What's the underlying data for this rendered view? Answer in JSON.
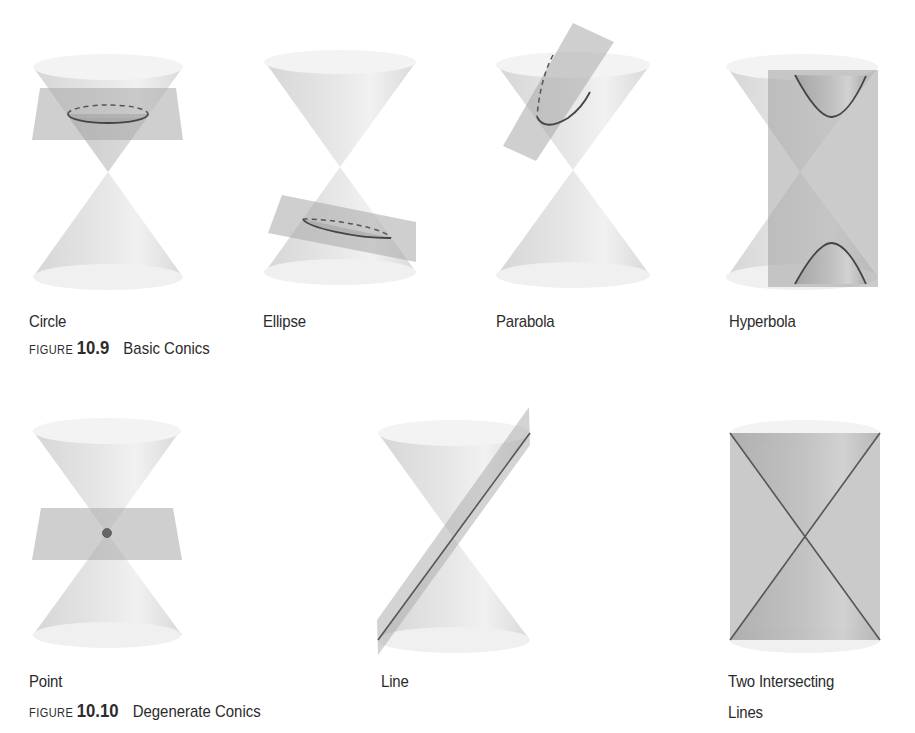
{
  "colors": {
    "background": "#ffffff",
    "cone_fill": "#e4e4e4",
    "cone_rim": "#f2f2f2",
    "plane_fill": "#bdbdbd",
    "curve_stroke": "#555555",
    "text": "#2b2b2b"
  },
  "figure_basic": {
    "word": "FIGURE",
    "number": "10.9",
    "title": "Basic Conics",
    "items": [
      {
        "label": "Circle",
        "type": "circle"
      },
      {
        "label": "Ellipse",
        "type": "ellipse"
      },
      {
        "label": "Parabola",
        "type": "parabola"
      },
      {
        "label": "Hyperbola",
        "type": "hyperbola"
      }
    ]
  },
  "figure_degenerate": {
    "word": "FIGURE",
    "number": "10.10",
    "title": "Degenerate Conics",
    "items": [
      {
        "label": "Point",
        "type": "point"
      },
      {
        "label": "Line",
        "type": "line"
      },
      {
        "label_line1": "Two Intersecting",
        "label_line2": "Lines",
        "type": "two-lines"
      }
    ]
  }
}
